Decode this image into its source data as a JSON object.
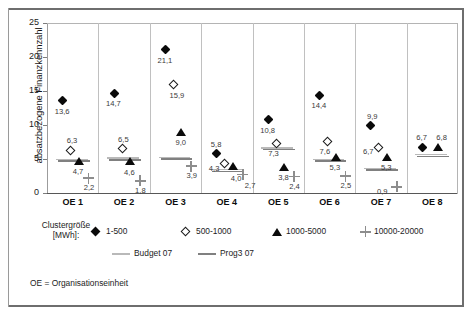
{
  "chart_data": {
    "type": "scatter",
    "title": "",
    "xlabel": "",
    "ylabel": "absatzbezogene Finanzkennzahl",
    "categories": [
      "OE 1",
      "OE 2",
      "OE 3",
      "OE 4",
      "OE 5",
      "OE 6",
      "OE 7",
      "OE 8"
    ],
    "ylim": [
      0,
      25
    ],
    "yticks": [
      0,
      5,
      10,
      15,
      20,
      25
    ],
    "grid": "vertical",
    "legend_position": "below",
    "series": [
      {
        "name": "1-500",
        "marker": "filled-diamond",
        "values": [
          13.6,
          14.7,
          21.1,
          5.8,
          10.8,
          14.4,
          9.9,
          6.7
        ],
        "labels": [
          "13,6",
          "14,7",
          "21,1",
          "5,8",
          "10,8",
          "14,4",
          "9,9",
          "6,7"
        ]
      },
      {
        "name": "500-1000",
        "marker": "open-diamond",
        "values": [
          6.3,
          6.5,
          15.9,
          4.3,
          7.3,
          7.6,
          6.7,
          null
        ],
        "labels": [
          "6,3",
          "6,5",
          "15,9",
          "4,3",
          "7,3",
          "7,6",
          "6,7",
          ""
        ]
      },
      {
        "name": "1000-5000",
        "marker": "filled-triangle",
        "values": [
          4.7,
          4.6,
          9.0,
          4.0,
          3.8,
          5.3,
          5.3,
          6.8
        ],
        "labels": [
          "4,7",
          "4,6",
          "9,0",
          "4,0",
          "3,8",
          "5,3",
          "5,3",
          "6,8"
        ]
      },
      {
        "name": "10000-20000",
        "marker": "plus",
        "values": [
          2.2,
          1.8,
          3.9,
          2.7,
          2.4,
          2.5,
          0.9,
          null
        ],
        "labels": [
          "2,2",
          "1,8",
          "3,9",
          "2,7",
          "2,4",
          "2,5",
          "0,9",
          ""
        ]
      }
    ],
    "reference_lines": [
      {
        "name": "Budget 07",
        "color": "#b9b9b9",
        "values": [
          4.8,
          5.0,
          5.1,
          3.3,
          6.5,
          4.8,
          3.5,
          5.5
        ]
      },
      {
        "name": "Prog3 07",
        "color": "#808080",
        "values": [
          4.8,
          5.0,
          5.1,
          3.3,
          6.5,
          4.8,
          3.5,
          5.5
        ]
      }
    ]
  },
  "axis": {
    "y_title": "absatzbezogene Finanzkennzahl",
    "y_ticks": [
      "0",
      "5",
      "10",
      "15",
      "20",
      "25"
    ],
    "x_ticks": [
      "OE 1",
      "OE 2",
      "OE 3",
      "OE 4",
      "OE 5",
      "OE 6",
      "OE 7",
      "OE 8"
    ]
  },
  "legend": {
    "title_line1": "Clustergröße",
    "title_line2": "[MWh]:",
    "marker_items": [
      {
        "label": "1-500",
        "marker": "filled-diamond"
      },
      {
        "label": "500-1000",
        "marker": "open-diamond"
      },
      {
        "label": "1000-5000",
        "marker": "filled-triangle"
      },
      {
        "label": "10000-20000",
        "marker": "plus"
      }
    ],
    "line_items": [
      {
        "label": "Budget 07",
        "color": "#b9b9b9"
      },
      {
        "label": "Prog3 07",
        "color": "#808080"
      }
    ]
  },
  "footnote": {
    "text": "OE = Organisationseinheit"
  }
}
